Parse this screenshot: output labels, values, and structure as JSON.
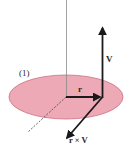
{
  "figure": {
    "plane_label": "(1)",
    "vectors": {
      "r": {
        "label": "r"
      },
      "V": {
        "label": "V"
      },
      "rxV": {
        "label": "r × V"
      }
    },
    "colors": {
      "plane_fill": "#eda5b2",
      "plane_stroke": "#c8687c",
      "vector": "#1a1a1a",
      "axis": "#8a8a8a"
    }
  }
}
